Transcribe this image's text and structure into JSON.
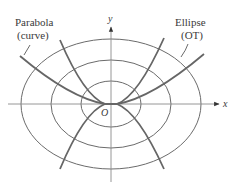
{
  "diagram": {
    "labels": {
      "parabola_title": "Parabola",
      "parabola_sub": "(curve)",
      "ellipse_title": "Ellipse",
      "ellipse_sub": "(OT)",
      "x_axis": "x",
      "y_axis": "y",
      "origin": "O"
    },
    "colors": {
      "ellipse_stroke": "#6b6b6b",
      "parabola_stroke": "#666666",
      "axis_stroke": "#8a8a8a",
      "text": "#3a3a3a"
    }
  }
}
